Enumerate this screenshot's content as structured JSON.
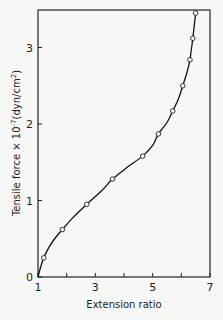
{
  "chart_data": {
    "type": "line",
    "title": "",
    "xlabel": "Extension ratio",
    "ylabel": "Tensile force × 10^-7 (dyn/cm^2)",
    "ylabel_parts": {
      "main": "Tensile force × 10",
      "exp": "-7",
      "unit": "(dyn/cm",
      "unit_exp": "2",
      "close": ")"
    },
    "xlim": [
      1,
      7
    ],
    "ylim": [
      0,
      3.5
    ],
    "xticks": [
      1,
      2,
      3,
      4,
      5,
      6,
      7
    ],
    "xtick_labels": [
      "1",
      "",
      "3",
      "",
      "5",
      "",
      "7"
    ],
    "yticks": [
      0,
      1,
      2,
      3
    ],
    "ytick_labels": [
      "0",
      "1",
      "2",
      "3"
    ],
    "grid": false,
    "legend": null,
    "series": [
      {
        "name": "Tensile force",
        "marker": "open-circle",
        "x": [
          1.2,
          1.85,
          2.7,
          3.6,
          4.65,
          5.2,
          5.7,
          6.05,
          6.3,
          6.4,
          6.5
        ],
        "y": [
          0.25,
          0.62,
          0.95,
          1.28,
          1.58,
          1.87,
          2.17,
          2.5,
          2.84,
          3.12,
          3.45
        ]
      }
    ],
    "curve": {
      "x": [
        1.0,
        1.1,
        1.2,
        1.4,
        1.6,
        1.85,
        2.2,
        2.7,
        3.2,
        3.6,
        4.1,
        4.65,
        5.0,
        5.2,
        5.5,
        5.7,
        5.9,
        6.05,
        6.2,
        6.3,
        6.4,
        6.5
      ],
      "y": [
        0.0,
        0.14,
        0.25,
        0.4,
        0.51,
        0.62,
        0.77,
        0.95,
        1.12,
        1.28,
        1.43,
        1.58,
        1.72,
        1.87,
        2.02,
        2.17,
        2.33,
        2.5,
        2.68,
        2.84,
        3.12,
        3.45
      ]
    }
  }
}
